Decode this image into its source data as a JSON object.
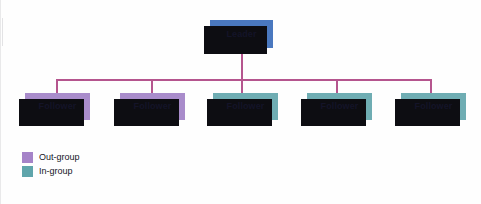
{
  "diagram": {
    "type": "organizational-chart",
    "background_color": "#fefefe",
    "connector_color": "#b5558e",
    "shadow_color": "#0d0d12"
  },
  "nodes": {
    "leader": {
      "label": "Leader",
      "group": "leader",
      "color": "#4a78bf",
      "x": 210,
      "y": 20,
      "w": 63,
      "h": 28
    },
    "followers": [
      {
        "label": "Follower",
        "group": "out-group",
        "color": "#a98ccb",
        "x": 25,
        "y": 93,
        "w": 65,
        "h": 27
      },
      {
        "label": "Follower",
        "group": "out-group",
        "color": "#a98ccb",
        "x": 120,
        "y": 93,
        "w": 65,
        "h": 27
      },
      {
        "label": "Follower",
        "group": "in-group",
        "color": "#6fadb3",
        "x": 213,
        "y": 93,
        "w": 65,
        "h": 27
      },
      {
        "label": "Follower",
        "group": "in-group",
        "color": "#6fadb3",
        "x": 307,
        "y": 93,
        "w": 65,
        "h": 27
      },
      {
        "label": "Follower",
        "group": "in-group",
        "color": "#6fadb3",
        "x": 401,
        "y": 93,
        "w": 65,
        "h": 27
      }
    ]
  },
  "connectors": {
    "leader_drop": {
      "x": 241,
      "y": 48,
      "h": 32
    },
    "bus": {
      "x": 56,
      "y": 79,
      "w": 375
    },
    "drops": [
      {
        "x": 56,
        "y": 79,
        "h": 14
      },
      {
        "x": 151,
        "y": 79,
        "h": 14
      },
      {
        "x": 241,
        "y": 79,
        "h": 14
      },
      {
        "x": 336,
        "y": 79,
        "h": 14
      },
      {
        "x": 430,
        "y": 79,
        "h": 14
      }
    ]
  },
  "legend": {
    "items": [
      {
        "label": "Out-group",
        "color": "#a583c8",
        "swatch_name": "out-group-swatch"
      },
      {
        "label": "In-group",
        "color": "#5fa5ab",
        "swatch_name": "in-group-swatch"
      }
    ]
  }
}
